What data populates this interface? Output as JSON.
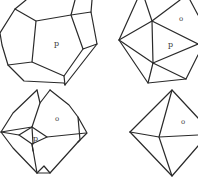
{
  "figures": [
    {
      "name": "pyritohedron",
      "position": "top-left",
      "labels": [
        {
          "text": "p",
          "x": 57,
          "y": 46
        }
      ]
    },
    {
      "name": "icosahedron",
      "position": "top-right",
      "labels": [
        {
          "text": "o",
          "x": 179,
          "y": 21
        },
        {
          "text": "p",
          "x": 169,
          "y": 47
        }
      ]
    },
    {
      "name": "octahedron-pyritohedron-combination",
      "position": "bottom-left",
      "labels": [
        {
          "text": "o",
          "x": 57,
          "y": 120
        },
        {
          "text": "p",
          "x": 34,
          "y": 138
        }
      ]
    },
    {
      "name": "octahedron",
      "position": "bottom-right",
      "labels": [
        {
          "text": "o",
          "x": 181,
          "y": 124
        }
      ]
    }
  ],
  "colors": {
    "line": "#2a2a2a",
    "label": "#3a3a3a",
    "background": "#ffffff"
  }
}
